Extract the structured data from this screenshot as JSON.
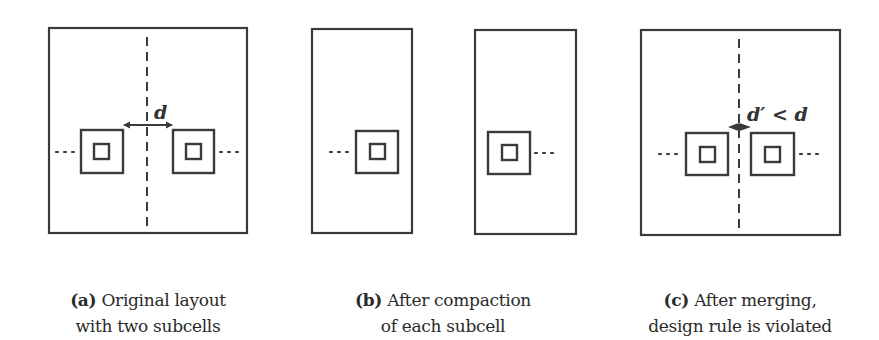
{
  "figure": {
    "panels": [
      {
        "id": "a",
        "tag": "(a)",
        "caption_line1": "Original layout",
        "caption_line2": "with two subcells",
        "label": "d"
      },
      {
        "id": "b",
        "tag": "(b)",
        "caption_line1": "After compaction",
        "caption_line2": "of each subcell"
      },
      {
        "id": "c",
        "tag": "(c)",
        "caption_line1": "After merging,",
        "caption_line2": "design rule is violated",
        "label": "d′ < d"
      }
    ],
    "colors": {
      "stroke": "#3a3a3a",
      "background": "#ffffff"
    }
  }
}
